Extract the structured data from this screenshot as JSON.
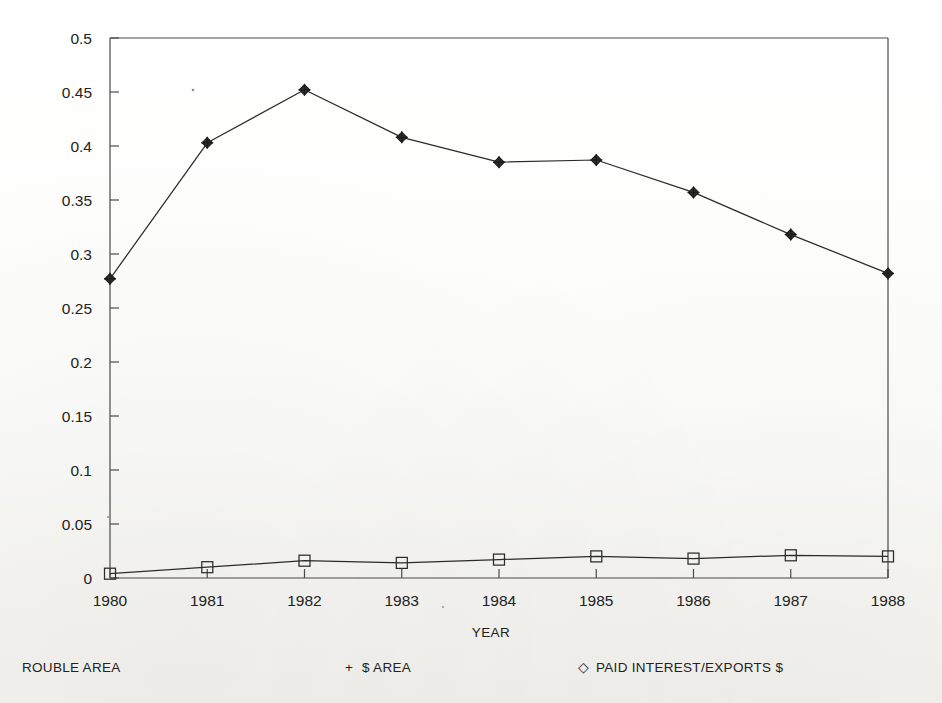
{
  "chart_data": {
    "type": "line",
    "title": "",
    "xlabel": "YEAR",
    "ylabel": "",
    "categories": [
      "1980",
      "1981",
      "1982",
      "1983",
      "1984",
      "1985",
      "1986",
      "1987",
      "1988"
    ],
    "x": [
      1980,
      1981,
      1982,
      1983,
      1984,
      1985,
      1986,
      1987,
      1988
    ],
    "xlim": [
      1980,
      1988
    ],
    "ylim": [
      0,
      0.5
    ],
    "ytick_labels": [
      "0",
      "0.05",
      "0.1",
      "0.15",
      "0.2",
      "0.25",
      "0.3",
      "0.35",
      "0.4",
      "0.45",
      "0.5"
    ],
    "ytick_values": [
      0,
      0.05,
      0.1,
      0.15,
      0.2,
      0.25,
      0.3,
      0.35,
      0.4,
      0.45,
      0.5
    ],
    "xtick_labels": [
      "1980",
      "1981",
      "1982",
      "1983",
      "1984",
      "1985",
      "1986",
      "1987",
      "1988"
    ],
    "grid": false,
    "legend_position": "below",
    "series": [
      {
        "name": "PAID INTEREST/EXPORTS $",
        "marker": "diamond-plus",
        "values": [
          0.277,
          0.403,
          0.452,
          0.408,
          0.385,
          0.387,
          0.357,
          0.318,
          0.282
        ]
      },
      {
        "name": "$ AREA",
        "marker": "square",
        "values": [
          0.004,
          0.01,
          0.016,
          0.014,
          0.017,
          0.02,
          0.018,
          0.021,
          0.02
        ]
      }
    ]
  },
  "axis": {
    "x_title": "YEAR"
  },
  "legend": {
    "items": [
      {
        "label": "ROUBLE AREA",
        "marker": "none"
      },
      {
        "label": "$ AREA",
        "marker": "+"
      },
      {
        "label": "PAID INTEREST/EXPORTS $",
        "marker": "◇"
      }
    ]
  },
  "colors": {
    "ink": "#2b2b2b",
    "axis": "#4a4a4a",
    "background": "#fbfbf9"
  }
}
